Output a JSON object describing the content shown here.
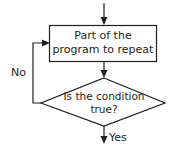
{
  "diagram": {
    "type": "flowchart",
    "process_box": {
      "line1": "Part of the",
      "line2": "program to repeat"
    },
    "decision": {
      "line1": "Is the condition",
      "line2": "true?"
    },
    "edges": {
      "no_label": "No",
      "yes_label": "Yes"
    },
    "colors": {
      "stroke": "#231f20",
      "background": "#ffffff"
    }
  }
}
